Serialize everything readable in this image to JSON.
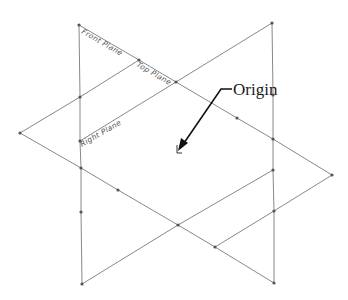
{
  "diagram": {
    "labels": {
      "front_plane": "Front Plane",
      "top_plane": "Top Plane",
      "right_plane": "Right Plane",
      "origin": "Origin"
    },
    "colors": {
      "edges": "#7a7a7a",
      "vertices": "#555555",
      "callout": "#111111",
      "background": "#ffffff"
    }
  }
}
